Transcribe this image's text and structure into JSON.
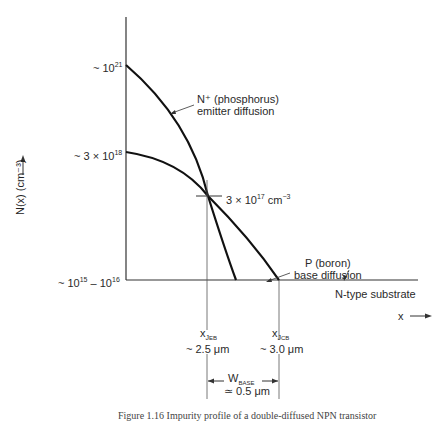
{
  "diagram": {
    "y_axis_label": "N(x) (cm⁻³)",
    "x_axis_label": "x",
    "y_ticks": [
      {
        "prefix": "~ 10",
        "sup": "21",
        "suffix": ""
      },
      {
        "prefix": "~ 3 × 10",
        "sup": "18",
        "suffix": ""
      },
      {
        "prefix": "~ 10",
        "sup": "15",
        "mid": " – 10",
        "sup2": "16"
      }
    ],
    "crossing_label": {
      "prefix": "3 × 10",
      "sup": "17",
      "unit": " cm",
      "unit_sup": "−3"
    },
    "curves": {
      "emitter": {
        "line1": "N⁺ (phosphorus)",
        "line2": "emitter diffusion"
      },
      "base": {
        "line1": "P (boron)",
        "line2": "base diffusion"
      },
      "substrate": "N-type substrate"
    },
    "junctions": {
      "eb": {
        "symbol": "x",
        "sub1": "J",
        "sub2": "EB",
        "value": "~ 2.5 μm"
      },
      "cb": {
        "symbol": "x",
        "sub1": "J",
        "sub2": "CB",
        "value": "~ 3.0 μm"
      }
    },
    "base_width": {
      "label": "W",
      "sub": "BASE",
      "value": "≃ 0.5 μm"
    }
  },
  "caption": "Figure 1.16  Impurity profile of a double-diffused NPN transistor"
}
